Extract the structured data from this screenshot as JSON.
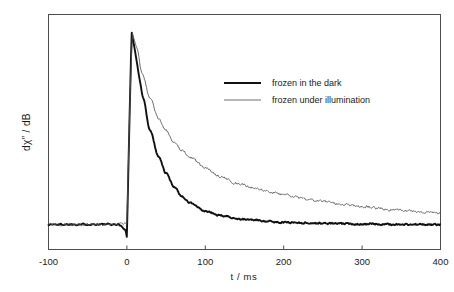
{
  "chart_data": {
    "type": "line",
    "title": "",
    "xlabel": "t  /  ms",
    "ylabel": "dχ” / dB",
    "xlim": [
      -100,
      400
    ],
    "ylim": [
      0,
      1.08
    ],
    "xticks": [
      -100,
      0,
      100,
      200,
      300,
      400
    ],
    "xtick_labels": [
      "-100",
      "0",
      "100",
      "200",
      "300",
      "400"
    ],
    "yticks": [],
    "ytick_labels": [],
    "grid": false,
    "legend_position": "upper-right-inside",
    "baseline_level": 0.115,
    "peak_time": 6,
    "peak_value": 1.0,
    "series": [
      {
        "name": "frozen in the dark",
        "color": "#111111",
        "line_width": 1.9,
        "noise": 0.006,
        "decay": {
          "model": "double-exponential-plus-baseline",
          "amp1": 0.62,
          "tau1": 22,
          "amp2": 0.265,
          "tau2": 62,
          "offset": 0.115
        },
        "points": [
          {
            "t": -100,
            "y": 0.115
          },
          {
            "t": -50,
            "y": 0.116
          },
          {
            "t": -10,
            "y": 0.115
          },
          {
            "t": -2,
            "y": 0.09
          },
          {
            "t": 0,
            "y": 0.06
          },
          {
            "t": 3,
            "y": 0.55
          },
          {
            "t": 6,
            "y": 1.0
          },
          {
            "t": 10,
            "y": 0.92
          },
          {
            "t": 20,
            "y": 0.7
          },
          {
            "t": 30,
            "y": 0.545
          },
          {
            "t": 40,
            "y": 0.43
          },
          {
            "t": 50,
            "y": 0.35
          },
          {
            "t": 60,
            "y": 0.29
          },
          {
            "t": 70,
            "y": 0.245
          },
          {
            "t": 80,
            "y": 0.215
          },
          {
            "t": 100,
            "y": 0.175
          },
          {
            "t": 120,
            "y": 0.155
          },
          {
            "t": 150,
            "y": 0.138
          },
          {
            "t": 200,
            "y": 0.125
          },
          {
            "t": 250,
            "y": 0.12
          },
          {
            "t": 300,
            "y": 0.117
          },
          {
            "t": 350,
            "y": 0.115
          },
          {
            "t": 400,
            "y": 0.114
          }
        ]
      },
      {
        "name": "frozen under illumination",
        "color": "#555555",
        "line_width": 0.85,
        "noise": 0.009,
        "decay": {
          "model": "double-exponential-plus-baseline",
          "amp1": 0.5,
          "tau1": 34,
          "amp2": 0.39,
          "tau2": 150,
          "offset": 0.115
        },
        "points": [
          {
            "t": -100,
            "y": 0.115
          },
          {
            "t": -50,
            "y": 0.116
          },
          {
            "t": -10,
            "y": 0.115
          },
          {
            "t": 0,
            "y": 0.12
          },
          {
            "t": 4,
            "y": 0.7
          },
          {
            "t": 7,
            "y": 0.995
          },
          {
            "t": 12,
            "y": 0.93
          },
          {
            "t": 20,
            "y": 0.8
          },
          {
            "t": 30,
            "y": 0.69
          },
          {
            "t": 40,
            "y": 0.605
          },
          {
            "t": 50,
            "y": 0.545
          },
          {
            "t": 60,
            "y": 0.495
          },
          {
            "t": 70,
            "y": 0.455
          },
          {
            "t": 80,
            "y": 0.425
          },
          {
            "t": 100,
            "y": 0.375
          },
          {
            "t": 120,
            "y": 0.335
          },
          {
            "t": 140,
            "y": 0.305
          },
          {
            "t": 160,
            "y": 0.285
          },
          {
            "t": 180,
            "y": 0.267
          },
          {
            "t": 200,
            "y": 0.25
          },
          {
            "t": 240,
            "y": 0.225
          },
          {
            "t": 280,
            "y": 0.205
          },
          {
            "t": 300,
            "y": 0.198
          },
          {
            "t": 340,
            "y": 0.183
          },
          {
            "t": 380,
            "y": 0.172
          },
          {
            "t": 400,
            "y": 0.168
          }
        ]
      }
    ],
    "legend": [
      {
        "label": "frozen in the dark",
        "color": "#111111",
        "line_width": 1.9
      },
      {
        "label": "frozen under illumination",
        "color": "#555555",
        "line_width": 0.85
      }
    ]
  },
  "axes": {
    "frame_color": "#4d4d4d",
    "background": "#ffffff"
  }
}
